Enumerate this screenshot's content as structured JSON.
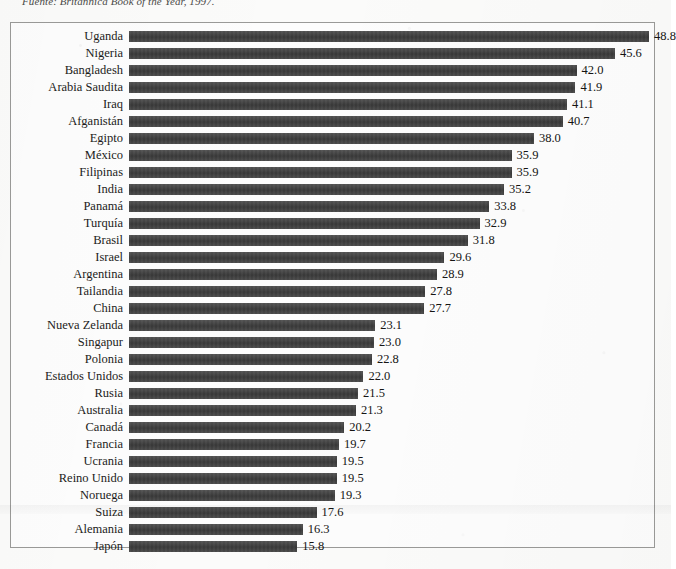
{
  "source_note": "Fuente: Britannica Book of the Year, 1997.",
  "colors": {
    "bar": "#3f3f3f",
    "frame": "#9a9a98",
    "text": "#1c1c1a",
    "paper": "#fbfbfa"
  },
  "chart_data": {
    "type": "bar",
    "orientation": "horizontal",
    "title": "",
    "subtitle": "",
    "xlabel": "",
    "ylabel": "",
    "grid": false,
    "legend": false,
    "xlim": [
      0,
      48.8
    ],
    "categories": [
      "Uganda",
      "Nigeria",
      "Bangladesh",
      "Arabia Saudita",
      "Iraq",
      "Afganistán",
      "Egipto",
      "México",
      "Filipinas",
      "India",
      "Panamá",
      "Turquía",
      "Brasil",
      "Israel",
      "Argentina",
      "Tailandia",
      "China",
      "Nueva Zelanda",
      "Singapur",
      "Polonia",
      "Estados Unidos",
      "Rusia",
      "Australia",
      "Canadá",
      "Francia",
      "Ucrania",
      "Reino Unido",
      "Noruega",
      "Suiza",
      "Alemania",
      "Japón"
    ],
    "values": [
      48.8,
      45.6,
      42.0,
      41.9,
      41.1,
      40.7,
      38.0,
      35.9,
      35.9,
      35.2,
      33.8,
      32.9,
      31.8,
      29.6,
      28.9,
      27.8,
      27.7,
      23.1,
      23.0,
      22.8,
      22.0,
      21.5,
      21.3,
      20.2,
      19.7,
      19.5,
      19.5,
      19.3,
      17.6,
      16.3,
      15.8
    ],
    "value_labels": [
      "48.8",
      "45.6",
      "42.0",
      "41.9",
      "41.1",
      "40.7",
      "38.0",
      "35.9",
      "35.9",
      "35.2",
      "33.8",
      "32.9",
      "31.8",
      "29.6",
      "28.9",
      "27.8",
      "27.7",
      "23.1",
      "23.0",
      "22.8",
      "22.0",
      "21.5",
      "21.3",
      "20.2",
      "19.7",
      "19.5",
      "19.5",
      "19.3",
      "17.6",
      "16.3",
      "15.8"
    ]
  }
}
